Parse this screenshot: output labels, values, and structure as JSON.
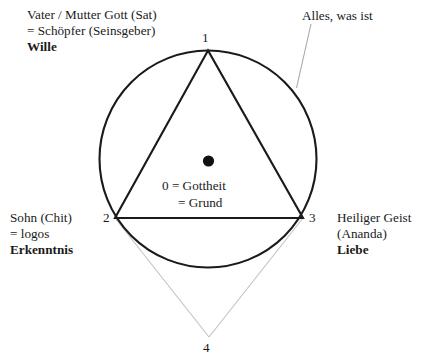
{
  "figure": {
    "title_alt": "Trinity circle-triangle diagram",
    "colors": {
      "stroke": "#1a1a1a",
      "faint_stroke": "#b9b9b9",
      "text": "#1a1a1a",
      "background": "#ffffff"
    },
    "geometry": {
      "circle": {
        "cx": 208,
        "cy": 159,
        "r": 108.5,
        "stroke_width": 2.1
      },
      "triangle": {
        "stroke_width": 2.1,
        "points": [
          {
            "id": "1",
            "x": 208,
            "y": 50.5
          },
          {
            "id": "2",
            "x": 115,
            "y": 218
          },
          {
            "id": "3",
            "x": 303,
            "y": 218
          }
        ]
      },
      "center_dot": {
        "cx": 208.5,
        "cy": 161,
        "r": 5.6
      },
      "point_four": {
        "x": 209,
        "y": 336
      },
      "leader_line": {
        "x1": 311,
        "y1": 24,
        "x2": 296.5,
        "y2": 88
      }
    }
  },
  "labels": {
    "father": {
      "line1": "Vater / Mutter Gott (Sat)",
      "line2": "= Schöpfer (Seinsgeber)",
      "line3": "Wille"
    },
    "son": {
      "line1": "Sohn (Chit)",
      "line2": "= logos",
      "line3": "Erkenntnis"
    },
    "spirit": {
      "line1": "Heiliger Geist",
      "line2": "(Ananda)",
      "line3": "Liebe"
    },
    "all_that_is": "Alles, was ist",
    "center": {
      "line1": "0 = Gottheit",
      "line2": "= Grund"
    }
  },
  "vertices": {
    "one": "1",
    "two": "2",
    "three": "3",
    "four": "4"
  }
}
